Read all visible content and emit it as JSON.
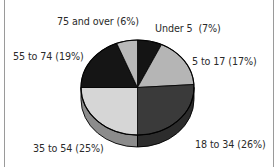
{
  "chart_data": {
    "type": "pie",
    "style": "3d",
    "title": "",
    "start_angle": "12 o'clock",
    "direction": "clockwise",
    "categories": [
      "Under 5",
      "5 to 17",
      "18 to 34",
      "35 to 54",
      "55 to 74",
      "75 and over"
    ],
    "values": [
      7,
      17,
      26,
      25,
      19,
      6
    ],
    "unit": "%",
    "labels": [
      "Under 5  (7%)",
      "5 to 17 (17%)",
      "18 to 34 (26%)",
      "35 to 54 (25%)",
      "55 to 74 (19%)",
      "75 and over (6%)"
    ],
    "colors": [
      "#141414",
      "#b5b5b5",
      "#3a3a3a",
      "#d6d6d6",
      "#151515",
      "#b9b9b9"
    ],
    "side_colors": [
      "#0c0c0c",
      "#808080",
      "#2c2c2c",
      "#8c8c8c",
      "#0c0c0c",
      "#808080"
    ],
    "legend": "none (data labels placed around pie)"
  },
  "labels": {
    "under5": "Under 5  (7%)",
    "age5to17": "5 to 17 (17%)",
    "age18to34": "18 to 34 (26%)",
    "age35to54": "35 to 54 (25%)",
    "age55to74": "55 to 74 (19%)",
    "age75plus": "75 and over (6%)"
  }
}
